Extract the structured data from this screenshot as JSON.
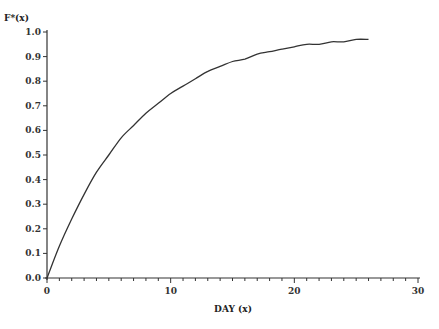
{
  "chart_data": {
    "type": "line",
    "title": "",
    "xlabel": "DAY (x)",
    "ylabel": "F*(x)",
    "xlim": [
      0,
      30
    ],
    "ylim": [
      0.0,
      1.0
    ],
    "grid": false,
    "legend": null,
    "x_ticks": [
      0,
      10,
      20,
      30
    ],
    "x_tick_labels": [
      "0",
      "10",
      "20",
      "30"
    ],
    "x_minor_tick_step": 1,
    "y_ticks": [
      0.0,
      0.1,
      0.2,
      0.3,
      0.4,
      0.5,
      0.6,
      0.7,
      0.8,
      0.9,
      1.0
    ],
    "y_tick_labels": [
      "0.0",
      "0.1",
      "0.2",
      "0.3",
      "0.4",
      "0.5",
      "0.6",
      "0.7",
      "0.8",
      "0.9",
      "1.0"
    ],
    "series": [
      {
        "name": "F*(x)",
        "color": "#333333",
        "x": [
          0,
          1,
          2,
          3,
          4,
          5,
          6,
          7,
          8,
          9,
          10,
          11,
          12,
          13,
          14,
          15,
          16,
          17,
          18,
          19,
          20,
          21,
          22,
          23,
          24,
          25,
          26
        ],
        "y": [
          0.0,
          0.13,
          0.24,
          0.34,
          0.43,
          0.5,
          0.57,
          0.62,
          0.67,
          0.71,
          0.75,
          0.78,
          0.81,
          0.84,
          0.86,
          0.88,
          0.89,
          0.91,
          0.92,
          0.93,
          0.94,
          0.95,
          0.95,
          0.96,
          0.96,
          0.97,
          0.97
        ]
      }
    ]
  },
  "layout": {
    "plot_left": 47,
    "plot_right": 418,
    "plot_top": 32,
    "plot_bottom": 278
  }
}
